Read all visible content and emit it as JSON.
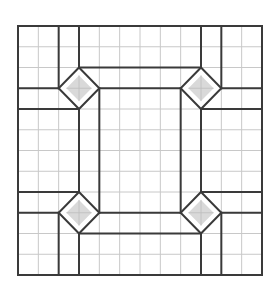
{
  "diagram": {
    "type": "grid-paper-pattern",
    "grid": {
      "columns": 12,
      "rows": 12,
      "origin_px": [
        18,
        26
      ],
      "size_px": [
        244,
        249
      ],
      "grid_color": "#c8c8c8",
      "line_color": "#3a3a3a",
      "background": "#ffffff"
    },
    "diamonds": [
      {
        "name": "top-left",
        "center": [
          3,
          3
        ],
        "radius": 1
      },
      {
        "name": "top-right",
        "center": [
          9,
          3
        ],
        "radius": 1
      },
      {
        "name": "bottom-left",
        "center": [
          3,
          9
        ],
        "radius": 1
      },
      {
        "name": "bottom-right",
        "center": [
          9,
          9
        ],
        "radius": 1
      }
    ],
    "diamond_fill": "#d9d9d9",
    "segments": [
      {
        "from": [
          2,
          0
        ],
        "to": [
          2,
          3
        ]
      },
      {
        "from": [
          3,
          0
        ],
        "to": [
          3,
          2
        ]
      },
      {
        "from": [
          0,
          3
        ],
        "to": [
          2,
          3
        ]
      },
      {
        "from": [
          0,
          4
        ],
        "to": [
          3,
          4
        ]
      },
      {
        "from": [
          3,
          2
        ],
        "to": [
          9,
          2
        ]
      },
      {
        "from": [
          4,
          3
        ],
        "to": [
          8,
          3
        ]
      },
      {
        "from": [
          9,
          0
        ],
        "to": [
          9,
          2
        ]
      },
      {
        "from": [
          10,
          0
        ],
        "to": [
          10,
          3
        ]
      },
      {
        "from": [
          10,
          3
        ],
        "to": [
          12,
          3
        ]
      },
      {
        "from": [
          9,
          4
        ],
        "to": [
          12,
          4
        ]
      },
      {
        "from": [
          3,
          4
        ],
        "to": [
          3,
          8
        ]
      },
      {
        "from": [
          4,
          3
        ],
        "to": [
          4,
          9
        ]
      },
      {
        "from": [
          8,
          3
        ],
        "to": [
          8,
          9
        ]
      },
      {
        "from": [
          9,
          4
        ],
        "to": [
          9,
          8
        ]
      },
      {
        "from": [
          0,
          8
        ],
        "to": [
          3,
          8
        ]
      },
      {
        "from": [
          0,
          9
        ],
        "to": [
          2,
          9
        ]
      },
      {
        "from": [
          2,
          9
        ],
        "to": [
          2,
          12
        ]
      },
      {
        "from": [
          3,
          10
        ],
        "to": [
          3,
          12
        ]
      },
      {
        "from": [
          4,
          9
        ],
        "to": [
          8,
          9
        ]
      },
      {
        "from": [
          3,
          10
        ],
        "to": [
          9,
          10
        ]
      },
      {
        "from": [
          9,
          8
        ],
        "to": [
          12,
          8
        ]
      },
      {
        "from": [
          10,
          9
        ],
        "to": [
          12,
          9
        ]
      },
      {
        "from": [
          10,
          9
        ],
        "to": [
          10,
          12
        ]
      },
      {
        "from": [
          9,
          10
        ],
        "to": [
          9,
          12
        ]
      }
    ]
  }
}
